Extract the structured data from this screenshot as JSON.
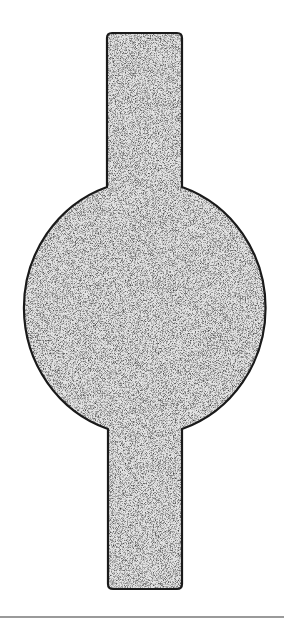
{
  "diagram": {
    "shape": {
      "top_bar": {
        "x": 107,
        "y": 33,
        "width": 75,
        "corner_radius": 5
      },
      "bulge": {
        "cx": 148,
        "cy": 308,
        "rx": 124,
        "ry": 128
      },
      "bottom_bar": {
        "x": 108,
        "y_end": 589,
        "width": 75,
        "corner_radius": 5
      },
      "fill_color": "#d9d9d9",
      "stroke_color": "#1a1a1a"
    },
    "baseline_color": "#9a9a9a"
  }
}
